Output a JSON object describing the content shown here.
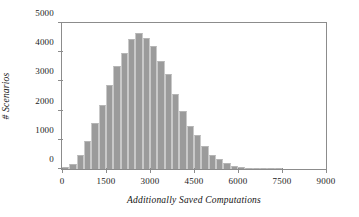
{
  "chart_data": {
    "type": "bar",
    "title": "",
    "subtitle": "",
    "xlabel": "Additionally Saved Computations",
    "ylabel": "# Scenarios",
    "xlim": [
      0,
      9000
    ],
    "ylim": [
      0,
      5000
    ],
    "xticks": [
      0,
      1500,
      3000,
      4500,
      6000,
      7500,
      9000
    ],
    "xtick_labels": [
      "0",
      "1500",
      "3000",
      "4500",
      "6000",
      "7500",
      "9000"
    ],
    "yticks": [
      0,
      1000,
      2000,
      3000,
      4000,
      5000
    ],
    "ytick_labels": [
      "0",
      "1000",
      "2000",
      "3000",
      "4000",
      "5000"
    ],
    "grid": false,
    "legend": null,
    "bin_width": 250,
    "bar_color": "#9b9b9b",
    "bar_edge_color": "#c9c9c9",
    "axis_color": "#8c8c8c",
    "categories": [
      125,
      375,
      625,
      875,
      1125,
      1375,
      1625,
      1875,
      2125,
      2375,
      2625,
      2875,
      3125,
      3375,
      3625,
      3875,
      4125,
      4375,
      4625,
      4875,
      5125,
      5375,
      5625,
      5875,
      6125,
      6375,
      6625,
      6875,
      7125,
      7375
    ],
    "values": [
      80,
      180,
      480,
      960,
      1560,
      2200,
      2870,
      3540,
      3980,
      4440,
      4650,
      4480,
      4200,
      3710,
      3240,
      2560,
      1990,
      1480,
      1150,
      780,
      480,
      340,
      200,
      90,
      60,
      40,
      25,
      15,
      10,
      5
    ],
    "bin_edges": [
      0,
      250,
      500,
      750,
      1000,
      1250,
      1500,
      1750,
      2000,
      2250,
      2500,
      2750,
      3000,
      3250,
      3500,
      3750,
      4000,
      4250,
      4500,
      4750,
      5000,
      5250,
      5500,
      5750,
      6000,
      6250,
      6500,
      6750,
      7000,
      7250,
      7500
    ]
  }
}
